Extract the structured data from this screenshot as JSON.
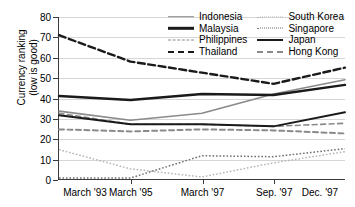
{
  "chart_data": {
    "type": "line",
    "title": "",
    "xlabel": "",
    "ylabel": "Currency ranking\n(low is good)",
    "categories": [
      "March '93",
      "March '95",
      "March '97",
      "Sep. '97",
      "Dec. '97"
    ],
    "ylim": [
      0,
      80
    ],
    "ytick_values": [
      0,
      10,
      20,
      30,
      40,
      50,
      60,
      70,
      80
    ],
    "grid": true,
    "legend_position": "top-right",
    "series": [
      {
        "name": "Indonesia",
        "values": [
          33.5,
          29.0,
          32.5,
          42.0,
          49.0
        ],
        "style": "solid",
        "color": "#8a8a8a",
        "width": 1.6
      },
      {
        "name": "Malaysia",
        "values": [
          41.0,
          39.0,
          42.0,
          41.5,
          46.5
        ],
        "style": "solid",
        "color": "#1a1a1a",
        "width": 2.4
      },
      {
        "name": "Philippines",
        "values": [
          32.5,
          27.0,
          27.0,
          26.0,
          27.5
        ],
        "style": "dashed",
        "color": "#8a8a8a",
        "width": 1.6
      },
      {
        "name": "Thailand",
        "values": [
          71.0,
          58.0,
          52.5,
          47.0,
          55.0
        ],
        "style": "dashed",
        "color": "#1a1a1a",
        "width": 2.4
      },
      {
        "name": "South Korea",
        "values": [
          14.5,
          5.0,
          1.0,
          8.0,
          13.5
        ],
        "style": "dotted",
        "color": "#b5b5b5",
        "width": 1.5
      },
      {
        "name": "Singapore",
        "values": [
          0.5,
          0.5,
          11.5,
          11.0,
          15.0
        ],
        "style": "dotted",
        "color": "#6f6f6f",
        "width": 1.5
      },
      {
        "name": "Japan",
        "values": [
          31.5,
          27.0,
          27.0,
          26.0,
          33.0
        ],
        "style": "solid",
        "color": "#1a1a1a",
        "width": 2.0
      },
      {
        "name": "Hong Kong",
        "values": [
          24.5,
          23.5,
          24.5,
          24.0,
          22.5
        ],
        "style": "dashed",
        "color": "#8a8a8a",
        "width": 2.0
      }
    ]
  },
  "legend": {
    "columns": [
      [
        "Indonesia",
        "Malaysia",
        "Philippines",
        "Thailand"
      ],
      [
        "South Korea",
        "Singapore",
        "Japan",
        "Hong Kong"
      ]
    ]
  }
}
